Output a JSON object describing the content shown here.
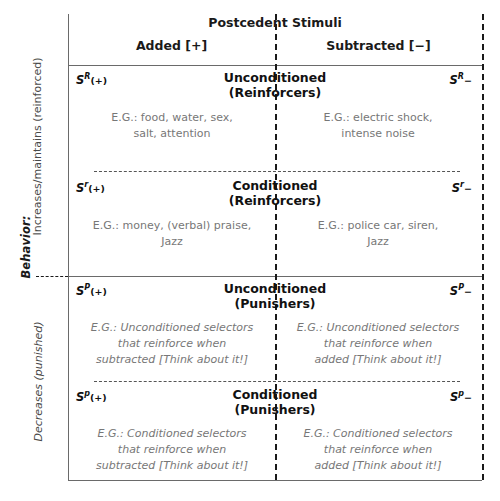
{
  "axes": {
    "behavior_label": "Behavior:",
    "top_half_label": "Increases/maintains (reinforced)",
    "bottom_half_label": "Decreases (punished)"
  },
  "header": {
    "main_title": "Postcedent Stimuli",
    "column_added": "Added [+]",
    "column_subtracted": "Subtracted [−]"
  },
  "bands": [
    {
      "id": "unconditioned-reinforcers",
      "title_line1": "Unconditioned",
      "title_line2": "(Reinforcers)",
      "left_symbol_base": "S",
      "left_symbol_sup": "R",
      "left_symbol_sign": "(+)",
      "right_symbol_base": "S",
      "right_symbol_sup": "R",
      "right_symbol_sign": "−",
      "left_example_line1": "E.G.: food, water, sex,",
      "left_example_line2": "salt, attention",
      "right_example_line1": "E.G.: electric shock,",
      "right_example_line2": "intense noise",
      "left_example_line3": "",
      "right_example_line3": ""
    },
    {
      "id": "conditioned-reinforcers",
      "title_line1": "Conditioned",
      "title_line2": "(Reinforcers)",
      "left_symbol_base": "S",
      "left_symbol_sup": "r",
      "left_symbol_sign": "(+)",
      "right_symbol_base": "S",
      "right_symbol_sup": "r",
      "right_symbol_sign": "−",
      "left_example_line1": "E.G.: money, (verbal) praise,",
      "left_example_line2": "Jazz",
      "right_example_line1": "E.G.: police car, siren,",
      "right_example_line2": "Jazz",
      "left_example_line3": "",
      "right_example_line3": ""
    },
    {
      "id": "unconditioned-punishers",
      "title_line1": "Unconditioned",
      "title_line2": "(Punishers)",
      "left_symbol_base": "S",
      "left_symbol_sup": "P",
      "left_symbol_sign": "(+)",
      "right_symbol_base": "S",
      "right_symbol_sup": "P",
      "right_symbol_sign": "−",
      "left_example_line1": "E.G.: Unconditioned selectors",
      "left_example_line2": "that reinforce when",
      "left_example_line3": "subtracted [Think about it!]",
      "right_example_line1": "E.G.: Unconditioned selectors",
      "right_example_line2": "that reinforce when",
      "right_example_line3": "added [Think about it!]"
    },
    {
      "id": "conditioned-punishers",
      "title_line1": "Conditioned",
      "title_line2": "(Punishers)",
      "left_symbol_base": "S",
      "left_symbol_sup": "p",
      "left_symbol_sign": "(+)",
      "right_symbol_base": "S",
      "right_symbol_sup": "p",
      "right_symbol_sign": "−",
      "left_example_line1": "E.G.: Conditioned selectors",
      "left_example_line2": "that reinforce when",
      "left_example_line3": "subtracted [Think about it!]",
      "right_example_line1": "E.G.: Conditioned selectors",
      "right_example_line2": "that reinforce when",
      "right_example_line3": "added [Think about it!]"
    }
  ],
  "colors": {
    "ink": "#1a1a1a",
    "rule": "#6a6a6a",
    "example_text": "#777777"
  }
}
